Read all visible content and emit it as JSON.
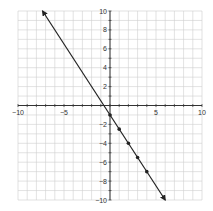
{
  "chart_data": {
    "type": "line",
    "title": "",
    "xlabel": "",
    "ylabel": "",
    "xlim": [
      -10,
      10
    ],
    "ylim": [
      -10,
      10
    ],
    "grid": true,
    "x_ticks": [
      -10,
      -5,
      5,
      10
    ],
    "y_ticks": [
      10,
      8,
      6,
      4,
      2,
      -2,
      -4,
      -6,
      -8,
      -10
    ],
    "line": {
      "equation": "y = -1.5x - 1",
      "slope": -1.5,
      "intercept": -1,
      "from": [
        -7.33,
        10
      ],
      "to": [
        6,
        -10
      ],
      "arrows": "both"
    },
    "series": [
      {
        "name": "points",
        "x": [
          0,
          1,
          2,
          3,
          4
        ],
        "y": [
          -1,
          -2.5,
          -4,
          -5.5,
          -7
        ]
      }
    ],
    "colors": {
      "line": "#222222",
      "grid": "#cfcfcf",
      "axis": "#333333"
    }
  }
}
